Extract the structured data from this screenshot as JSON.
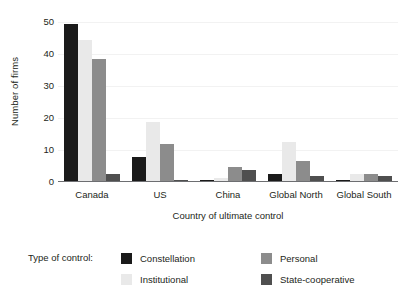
{
  "chart_data": {
    "type": "bar",
    "title": "",
    "xlabel": "Country of ultimate control",
    "ylabel": "Number of firms",
    "categories": [
      "Canada",
      "US",
      "China",
      "Global North",
      "Global South"
    ],
    "series": [
      {
        "name": "Constellation",
        "color": "#1a1a1a",
        "values": [
          49,
          7.5,
          0.3,
          2.2,
          0.3
        ]
      },
      {
        "name": "Institutional",
        "color": "#e9e9e9",
        "values": [
          44,
          18.5,
          1.0,
          12.3,
          2.3
        ]
      },
      {
        "name": "Personal",
        "color": "#8c8c8c",
        "values": [
          38,
          11.5,
          4.3,
          6.3,
          2.3
        ]
      },
      {
        "name": "State-cooperative",
        "color": "#4f4f4f",
        "values": [
          2.3,
          0.3,
          3.3,
          1.5,
          1.5
        ]
      }
    ],
    "ylim": [
      0,
      50
    ],
    "yticks": [
      0,
      10,
      20,
      30,
      40,
      50
    ],
    "ytick_labels": [
      "0",
      "10",
      "20",
      "30",
      "40",
      "50"
    ],
    "grid": true,
    "legend_position": "below",
    "legend_title": "Type of control:"
  }
}
